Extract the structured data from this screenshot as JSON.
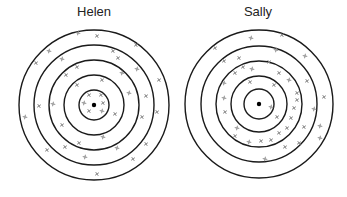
{
  "targets": [
    {
      "name": "Helen",
      "title_x": 94,
      "center": [
        94,
        105
      ],
      "radii": [
        75,
        60,
        45,
        30,
        15
      ],
      "marks": [
        [
          78,
          33
        ],
        [
          97,
          36
        ],
        [
          136,
          45
        ],
        [
          49,
          51
        ],
        [
          113,
          51
        ],
        [
          36,
          63
        ],
        [
          62,
          59
        ],
        [
          118,
          58
        ],
        [
          77,
          67
        ],
        [
          137,
          69
        ],
        [
          66,
          75
        ],
        [
          102,
          80
        ],
        [
          122,
          73
        ],
        [
          159,
          80
        ],
        [
          77,
          85
        ],
        [
          129,
          93
        ],
        [
          146,
          96
        ],
        [
          39,
          106
        ],
        [
          53,
          104
        ],
        [
          89,
          95
        ],
        [
          101,
          95
        ],
        [
          84,
          103
        ],
        [
          103,
          103
        ],
        [
          89,
          111
        ],
        [
          102,
          111
        ],
        [
          115,
          114
        ],
        [
          157,
          112
        ],
        [
          25,
          117
        ],
        [
          142,
          117
        ],
        [
          62,
          125
        ],
        [
          103,
          137
        ],
        [
          79,
          143
        ],
        [
          65,
          147
        ],
        [
          117,
          148
        ],
        [
          146,
          144
        ],
        [
          47,
          150
        ],
        [
          85,
          157
        ],
        [
          133,
          159
        ],
        [
          97,
          174
        ]
      ]
    },
    {
      "name": "Sally",
      "title_x": 258,
      "center": [
        259,
        104
      ],
      "radii": [
        74,
        58,
        43,
        28,
        15
      ],
      "marks": [
        [
          251,
          38
        ],
        [
          282,
          35
        ],
        [
          215,
          48
        ],
        [
          276,
          50
        ],
        [
          224,
          61
        ],
        [
          239,
          58
        ],
        [
          305,
          56
        ],
        [
          269,
          62
        ],
        [
          243,
          67
        ],
        [
          252,
          69
        ],
        [
          235,
          73
        ],
        [
          279,
          73
        ],
        [
          289,
          80
        ],
        [
          250,
          82
        ],
        [
          307,
          81
        ],
        [
          224,
          83
        ],
        [
          274,
          85
        ],
        [
          297,
          93
        ],
        [
          224,
          98
        ],
        [
          297,
          100
        ],
        [
          324,
          97
        ],
        [
          271,
          107
        ],
        [
          294,
          108
        ],
        [
          225,
          112
        ],
        [
          314,
          109
        ],
        [
          277,
          117
        ],
        [
          291,
          118
        ],
        [
          237,
          128
        ],
        [
          287,
          128
        ],
        [
          304,
          127
        ],
        [
          320,
          126
        ],
        [
          279,
          133
        ],
        [
          235,
          136
        ],
        [
          249,
          142
        ],
        [
          261,
          141
        ],
        [
          271,
          140
        ],
        [
          320,
          138
        ],
        [
          299,
          143
        ],
        [
          285,
          147
        ],
        [
          265,
          159
        ]
      ]
    }
  ],
  "colors": {
    "ring": "#1a1a1a",
    "mark": "#888888",
    "dot": "#000000"
  }
}
